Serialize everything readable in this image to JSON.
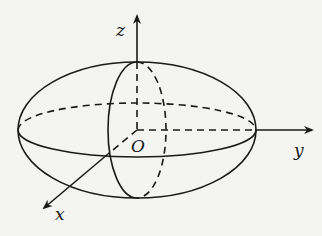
{
  "diagram": {
    "labels": {
      "z": "z",
      "y": "y",
      "x": "x",
      "origin": "O"
    },
    "colors": {
      "stroke": "#1a1a1a",
      "background": "#f4f4f2"
    }
  }
}
